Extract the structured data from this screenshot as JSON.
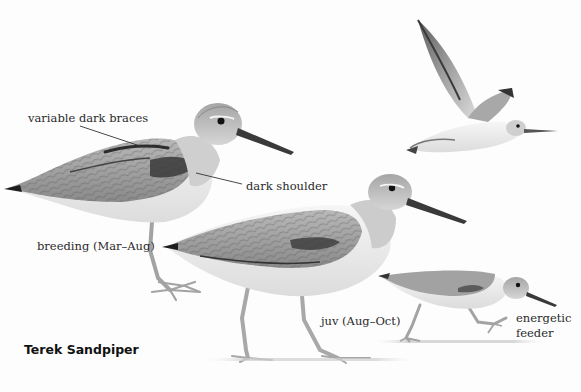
{
  "plate": {
    "title": "Terek Sandpiper",
    "background": "#fdfdfd"
  },
  "figures": [
    {
      "id": "breeding",
      "caption": "breeding (Mar–Aug)",
      "pose": "standing"
    },
    {
      "id": "flight",
      "caption": "",
      "pose": "flying"
    },
    {
      "id": "juvenile",
      "caption": "juv (Aug–Oct)",
      "pose": "walking"
    },
    {
      "id": "feeding",
      "caption_lines": [
        "energetic",
        "feeder"
      ],
      "pose": "running"
    }
  ],
  "annotations": [
    {
      "text": "variable dark braces",
      "points_to": "breeding scapulars"
    },
    {
      "text": "dark shoulder",
      "points_to": "breeding shoulder"
    }
  ],
  "colors": {
    "plumage_grey": "#9a9a9a",
    "plumage_light": "#c8c8c8",
    "belly": "#f2f2f2",
    "dark_marks": "#2b2b2b",
    "legs": "#a9a9a9",
    "text": "#2a2a2a"
  }
}
